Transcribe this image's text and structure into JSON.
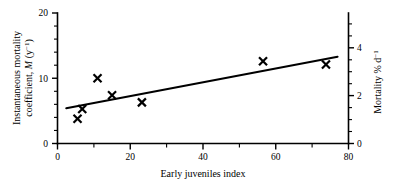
{
  "chart_data": {
    "type": "scatter",
    "title": "",
    "xlabel": "Early juveniles index",
    "ylabel": "Instantaneous mortality coefficient, M (y⁻¹)",
    "ylabel_right": "Mortality % d⁻¹",
    "xlim": [
      0,
      80
    ],
    "ylim": [
      0,
      20
    ],
    "ylim_right": [
      0,
      5.45
    ],
    "grid": false,
    "legend": "none",
    "x_major_ticks": [
      0,
      20,
      40,
      60,
      80
    ],
    "x_minor_ticks": [
      10,
      30,
      50,
      70
    ],
    "y_major_ticks": [
      0,
      10,
      20
    ],
    "y_minor_ticks": [
      2,
      4,
      6,
      8,
      12,
      14,
      16,
      18
    ],
    "y_right_major_ticks": [
      0,
      2,
      4
    ],
    "y_right_minor_ticks": [
      0.5,
      1,
      1.5,
      2.5,
      3,
      3.5,
      4.5,
      5
    ],
    "x_tick_labels": [
      "0",
      "20",
      "40",
      "60",
      "80"
    ],
    "y_tick_labels": [
      "0",
      "10",
      "20"
    ],
    "y_right_tick_labels": [
      "0",
      "2",
      "4"
    ],
    "marker_style": "bold-x",
    "marker_color": "#000000",
    "line_color": "#000000",
    "points": [
      {
        "x": 5.5,
        "y": 3.8
      },
      {
        "x": 6.8,
        "y": 5.3
      },
      {
        "x": 11.0,
        "y": 10.0
      },
      {
        "x": 15.0,
        "y": 7.4
      },
      {
        "x": 23.2,
        "y": 6.3
      },
      {
        "x": 56.5,
        "y": 12.6
      },
      {
        "x": 73.8,
        "y": 12.1
      }
    ],
    "series": [
      {
        "name": "observations",
        "x": [
          5.5,
          6.8,
          11.0,
          15.0,
          23.2,
          56.5,
          73.8
        ],
        "values": [
          3.8,
          5.3,
          10.0,
          7.4,
          6.3,
          12.6,
          12.1
        ]
      }
    ],
    "fit_line": {
      "name": "regression",
      "x": [
        2.4,
        77.0
      ],
      "values": [
        5.4,
        13.3
      ]
    }
  },
  "axes": {
    "x_title": "Early juveniles index",
    "y_left": {
      "line1": "Instantaneous mortality",
      "line2_pre": "coefficient, ",
      "line2_ital": "M",
      "line2_unit_open": " (y",
      "line2_unit_sup": "−1",
      "line2_unit_close": ")"
    },
    "y_right": {
      "text_pre": "Mortality % d",
      "text_sup": "−1"
    }
  }
}
